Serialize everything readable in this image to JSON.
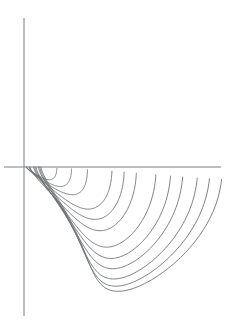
{
  "figure": {
    "title": "",
    "kind": "contour-plot",
    "background_color": "#ffffff",
    "width": 237,
    "height": 331
  },
  "chart_data": {
    "type": "line",
    "title": "",
    "subtitle": "",
    "xlabel": "",
    "ylabel": "",
    "grid": false,
    "legend": null,
    "legend_position": "none",
    "xlim": [
      -0.2,
      8.2
    ],
    "ylim": [
      -6.1,
      6.1
    ],
    "origin_px": [
      25,
      167
    ],
    "scale_px_per_unit": 24.5,
    "stroke_color": "#666a6e",
    "stroke_width": 0.85,
    "axes": [
      {
        "name": "vertical-axis",
        "orientation": "vertical",
        "x_px": 24,
        "y_start_px": 18,
        "y_end_px": 316,
        "color": "#7c7f83"
      },
      {
        "name": "horizontal-axis",
        "orientation": "horizontal",
        "y_px": 167,
        "x_start_px": 4,
        "x_end_px": 221,
        "color": "#7c7f83"
      }
    ],
    "curve_family": "r(theta) = a / (1 + k*cos(theta)) style nested lobes",
    "curves": [
      {
        "id": 1,
        "axis_crossing_x": 1.3,
        "back_extent_x": 0.06,
        "half_height": 0.62,
        "tilt": 0.0
      },
      {
        "id": 2,
        "axis_crossing_x": 1.9,
        "back_extent_x": 0.06,
        "half_height": 0.95,
        "tilt": 0.0
      },
      {
        "id": 3,
        "axis_crossing_x": 2.55,
        "back_extent_x": 0.06,
        "half_height": 1.35,
        "tilt": 0.0
      },
      {
        "id": 4,
        "axis_crossing_x": 3.55,
        "back_extent_x": 0.18,
        "half_height": 2.05,
        "tilt": 0.1
      },
      {
        "id": 5,
        "axis_crossing_x": 4.05,
        "back_extent_x": 0.18,
        "half_height": 2.55,
        "tilt": 0.14
      },
      {
        "id": 6,
        "axis_crossing_x": 4.55,
        "back_extent_x": 0.2,
        "half_height": 3.1,
        "tilt": 0.2
      },
      {
        "id": 7,
        "axis_crossing_x": 5.35,
        "back_extent_x": 0.35,
        "half_height": 3.9,
        "tilt": 0.3
      },
      {
        "id": 8,
        "axis_crossing_x": 5.95,
        "back_extent_x": 0.4,
        "half_height": 4.45,
        "tilt": 0.36
      },
      {
        "id": 9,
        "axis_crossing_x": 6.45,
        "back_extent_x": 0.45,
        "half_height": 4.95,
        "tilt": 0.42
      },
      {
        "id": 10,
        "axis_crossing_x": 7.05,
        "back_extent_x": 0.55,
        "half_height": 5.45,
        "tilt": 0.5
      },
      {
        "id": 11,
        "axis_crossing_x": 7.55,
        "back_extent_x": 0.6,
        "half_height": 5.8,
        "tilt": 0.55
      },
      {
        "id": 12,
        "axis_crossing_x": 8.05,
        "back_extent_x": 0.65,
        "half_height": 6.05,
        "tilt": 0.6
      }
    ],
    "axis_crossings_px": [
      57,
      72,
      88,
      112,
      124,
      136,
      156,
      171,
      183,
      198,
      210,
      222
    ]
  }
}
